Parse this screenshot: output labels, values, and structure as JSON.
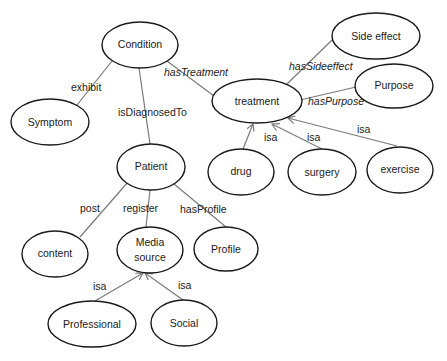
{
  "diagram": {
    "type": "ontology-graph",
    "nodes": [
      {
        "id": "condition",
        "label": "Condition",
        "cx": 140,
        "cy": 45,
        "rx": 38,
        "ry": 23
      },
      {
        "id": "symptom",
        "label": "Symptom",
        "cx": 50,
        "cy": 122,
        "rx": 40,
        "ry": 23
      },
      {
        "id": "patient",
        "label": "Patient",
        "cx": 151,
        "cy": 167,
        "rx": 34,
        "ry": 23
      },
      {
        "id": "treatment",
        "label": "treatment",
        "cx": 257,
        "cy": 101,
        "rx": 44,
        "ry": 22
      },
      {
        "id": "side_effect",
        "label": "Side effect",
        "cx": 375,
        "cy": 37,
        "rx": 44,
        "ry": 23
      },
      {
        "id": "purpose",
        "label": "Purpose",
        "cx": 394,
        "cy": 86,
        "rx": 39,
        "ry": 22
      },
      {
        "id": "drug",
        "label": "drug",
        "cx": 240,
        "cy": 172,
        "rx": 33,
        "ry": 23
      },
      {
        "id": "surgery",
        "label": "surgery",
        "cx": 322,
        "cy": 172,
        "rx": 34,
        "ry": 23
      },
      {
        "id": "exercise",
        "label": "exercise",
        "cx": 403,
        "cy": 169,
        "rx": 34,
        "ry": 23
      },
      {
        "id": "content",
        "label": "content",
        "cx": 55,
        "cy": 254,
        "rx": 33,
        "ry": 23
      },
      {
        "id": "media_source",
        "label": "Media source",
        "line1": "Media",
        "line2": "source",
        "cx": 150,
        "cy": 250,
        "rx": 33,
        "ry": 23
      },
      {
        "id": "profile",
        "label": "Profile",
        "cx": 229,
        "cy": 249,
        "rx": 32,
        "ry": 22
      },
      {
        "id": "professional",
        "label": "Professional",
        "cx": 92,
        "cy": 324,
        "rx": 44,
        "ry": 23
      },
      {
        "id": "social",
        "label": "Social",
        "cx": 184,
        "cy": 323,
        "rx": 33,
        "ry": 23
      }
    ],
    "edges": [
      {
        "from": "condition",
        "to": "symptom",
        "label": "exhibit",
        "italic": false
      },
      {
        "from": "condition",
        "to": "patient",
        "label": "isDiagnosedTo",
        "italic": false
      },
      {
        "from": "condition",
        "to": "treatment",
        "label": "hasTreatment",
        "italic": true
      },
      {
        "from": "treatment",
        "to": "side_effect",
        "label": "hasSideeffect",
        "italic": true
      },
      {
        "from": "treatment",
        "to": "purpose",
        "label": "hasPurpose",
        "italic": true
      },
      {
        "from": "drug",
        "to": "treatment",
        "label": "isa",
        "italic": false,
        "arrow": true
      },
      {
        "from": "surgery",
        "to": "treatment",
        "label": "isa",
        "italic": false,
        "arrow": true
      },
      {
        "from": "exercise",
        "to": "treatment",
        "label": "isa",
        "italic": false,
        "arrow": true
      },
      {
        "from": "patient",
        "to": "content",
        "label": "post",
        "italic": false
      },
      {
        "from": "patient",
        "to": "media_source",
        "label": "register",
        "italic": false
      },
      {
        "from": "patient",
        "to": "profile",
        "label": "hasProfile",
        "italic": false
      },
      {
        "from": "professional",
        "to": "media_source",
        "label": "isa",
        "italic": false,
        "arrow": true
      },
      {
        "from": "social",
        "to": "media_source",
        "label": "isa",
        "italic": false,
        "arrow": true
      }
    ]
  },
  "labels": {
    "exhibit": "exhibit",
    "isDiagnosedTo": "isDiagnosedTo",
    "hasTreatment": "hasTreatment",
    "hasSideeffect": "hasSideeffect",
    "hasPurpose": "hasPurpose",
    "isa": "isa",
    "post": "post",
    "register": "register",
    "hasProfile": "hasProfile"
  },
  "nodes_text": {
    "condition": "Condition",
    "symptom": "Symptom",
    "patient": "Patient",
    "treatment": "treatment",
    "side_effect": "Side effect",
    "purpose": "Purpose",
    "drug": "drug",
    "surgery": "surgery",
    "exercise": "exercise",
    "content": "content",
    "media_line1": "Media",
    "media_line2": "source",
    "profile": "Profile",
    "professional": "Professional",
    "social": "Social"
  }
}
